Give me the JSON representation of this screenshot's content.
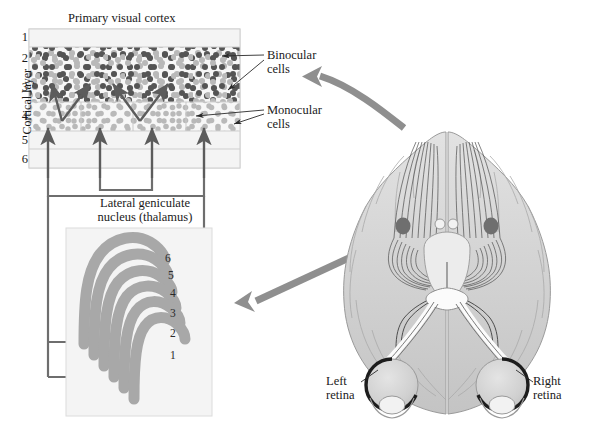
{
  "figure": {
    "width": 591,
    "height": 434,
    "background": "#ffffff"
  },
  "cortex_panel": {
    "title": "Primary visual cortex",
    "axis_label": "Cortical layer",
    "layer_numbers": [
      "1",
      "2",
      "3",
      "4",
      "5",
      "6"
    ],
    "annotations": {
      "binocular_line1": "Binocular",
      "binocular_line2": "cells",
      "monocular_line1": "Monocular",
      "monocular_line2": "cells"
    }
  },
  "lgn_panel": {
    "title_line1": "Lateral geniculate",
    "title_line2": "nucleus (thalamus)",
    "layer_numbers": [
      "1",
      "2",
      "3",
      "4",
      "5",
      "6"
    ]
  },
  "brain_panel": {
    "left_retina_line1": "Left",
    "left_retina_line2": "retina",
    "right_retina_line1": "Right",
    "right_retina_line2": "retina"
  },
  "colors": {
    "ink": "#1a1a1a",
    "connector": "#6e6e6e",
    "arrow_gray": "#8f8f8f",
    "dot_dark": "#555555",
    "dot_light": "#b9b9b9",
    "panel_fill": "#f3f3f3",
    "panel_stroke": "#d6d6d6",
    "lgn_band": "#a8a8a8",
    "brain_fill": "#d8d8d8",
    "brain_shade": "#bdbdbd",
    "eye_fill": "#d2d2d2"
  }
}
